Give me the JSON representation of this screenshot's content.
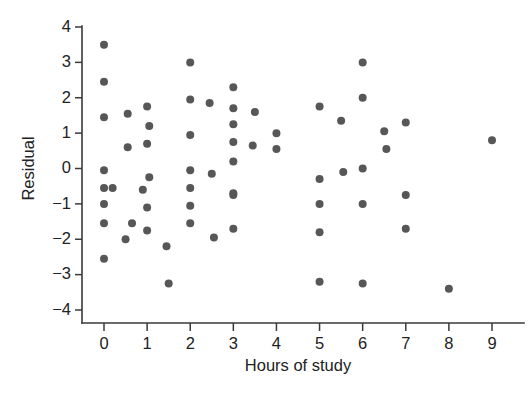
{
  "chart_data": {
    "type": "scatter",
    "title": "",
    "xlabel": "Hours of study",
    "ylabel": "Residual",
    "xlim": [
      -0.55,
      9.7
    ],
    "ylim": [
      -4.35,
      4.3
    ],
    "xticks": [
      0,
      1,
      2,
      3,
      4,
      5,
      6,
      7,
      8,
      9
    ],
    "xtick_labels": [
      "0",
      "1",
      "2",
      "3",
      "4",
      "5",
      "6",
      "7",
      "8",
      "9"
    ],
    "yticks": [
      -4,
      -3,
      -2,
      -1,
      0,
      1,
      2,
      3,
      4
    ],
    "ytick_labels": [
      "−4",
      "−3",
      "−2",
      "−1",
      "0",
      "1",
      "2",
      "3",
      "4"
    ],
    "grid": false,
    "legend": null,
    "marker": "circle",
    "marker_color": "#575757",
    "marker_size": 7.2,
    "n_points": 63,
    "x": [
      0,
      0,
      0,
      0,
      0,
      0.2,
      0,
      0,
      0,
      0.55,
      0.55,
      0.9,
      0.65,
      0.5,
      1.0,
      1.05,
      1.0,
      1.05,
      1.0,
      1.0,
      1.45,
      1.5,
      2.0,
      2.0,
      2.0,
      2.0,
      2.0,
      2.0,
      2.0,
      2.45,
      2.5,
      2.55,
      3.0,
      3.0,
      3.0,
      3.0,
      3.0,
      3.0,
      3.0,
      3.0,
      3.5,
      3.45,
      4.0,
      4.0,
      5.0,
      5.0,
      5.0,
      5.0,
      5.0,
      5.5,
      5.55,
      6.0,
      6.0,
      6.0,
      6.0,
      6.0,
      6.5,
      6.55,
      7.0,
      7.0,
      7.0,
      8.0,
      9.0
    ],
    "y": [
      3.5,
      2.45,
      1.45,
      -0.05,
      -0.55,
      -0.55,
      -1.0,
      -1.55,
      -2.55,
      1.55,
      0.6,
      -0.6,
      -1.55,
      -2.0,
      1.75,
      1.2,
      0.7,
      -0.25,
      -1.1,
      -1.75,
      -2.2,
      -3.25,
      3.0,
      1.95,
      0.95,
      -0.05,
      -0.55,
      -1.05,
      -1.55,
      1.85,
      -0.15,
      -1.95,
      2.3,
      1.7,
      1.25,
      0.75,
      0.2,
      -0.7,
      -0.75,
      -1.7,
      1.6,
      0.65,
      1.0,
      0.55,
      1.75,
      -0.3,
      -1.0,
      -1.8,
      -3.2,
      1.35,
      -0.1,
      3.0,
      2.0,
      0.0,
      -1.0,
      -3.25,
      1.05,
      0.55,
      1.3,
      -0.75,
      -1.7,
      -3.4,
      0.8
    ]
  }
}
